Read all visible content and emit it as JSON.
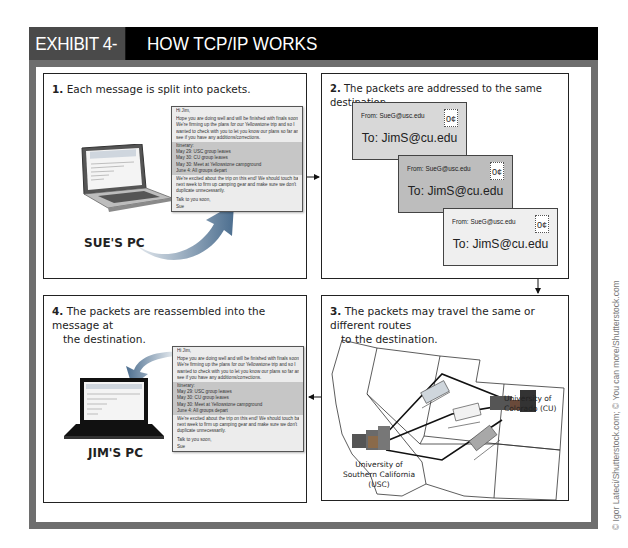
{
  "header": {
    "exhibit_label": "EXHIBIT 4-15",
    "title": "HOW TCP/IP WORKS"
  },
  "colors": {
    "frame": "#6e6e6e",
    "header_bg": "#000000",
    "exhibit_bg": "#4a4a4a",
    "envelope_1": "#d8d8d8",
    "envelope_2": "#bdbdbd",
    "envelope_3": "#efefef",
    "arrow_gradient": "#4a6d8c"
  },
  "steps": [
    {
      "number": "1.",
      "text": "Each message is split into packets.",
      "pc_label": "SUE'S PC"
    },
    {
      "number": "2.",
      "text": "The packets are addressed to the same destination."
    },
    {
      "number": "3.",
      "text": "The packets may travel the same or different routes",
      "text2": "to the destination."
    },
    {
      "number": "4.",
      "text": "The packets are reassembled into the message at",
      "text2": "the destination.",
      "pc_label": "JIM'S PC"
    }
  ],
  "message": {
    "greeting": "Hi  Jim,",
    "para1": [
      "Hope you are doing well and will be finished with finals soon.",
      "We're firming up the plans for our Yellowstone trip and so I",
      "wanted to check with you to let you know our plans so far and",
      "see if you have any additions/corrections."
    ],
    "itinerary": [
      "Itinerary:",
      "May 29: USC group leaves",
      "May 30: CU group leaves",
      "May 30: Meet at Yellowstone campground",
      "June 4: All groups depart"
    ],
    "para2": [
      "We're excited about the trip on this end! We should touch base",
      "next week to firm up camping gear and make sure we don't",
      "duplicate unnecessarily."
    ],
    "closing": "Talk to you soon,",
    "signature": "Sue"
  },
  "envelopes": [
    {
      "from": "From: SueG@usc.edu",
      "to": "To: JimS@cu.edu",
      "stamp": "0¢"
    },
    {
      "from": "From: SueG@usc.edu",
      "to": "To: JimS@cu.edu",
      "stamp": "0¢"
    },
    {
      "from": "From: SueG@usc.edu",
      "to": "To: JimS@cu.edu",
      "stamp": "0¢"
    }
  ],
  "map": {
    "origin": [
      "University of",
      "Southern California",
      "(USC)"
    ],
    "destination": [
      "University of",
      "Colorado (CU)"
    ]
  },
  "credit": "© Igor Lateci/Shutterstock.com; © You can more/Shutterstock.com"
}
